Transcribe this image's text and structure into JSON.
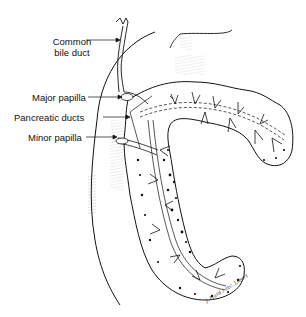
{
  "diagram": {
    "style": "black and white anatomical line drawing",
    "labels": [
      {
        "id": "common-bile-duct",
        "text_line1": "Common",
        "text_line2": "bile duct"
      },
      {
        "id": "major-papilla",
        "text": "Major papilla"
      },
      {
        "id": "pancreatic-ducts",
        "text": "Pancreatic ducts"
      },
      {
        "id": "minor-papilla",
        "text": "Minor papilla"
      }
    ],
    "signature": "J. Hard / etc. Libert",
    "colors": {
      "ink": "#111111",
      "background": "#ffffff",
      "shading": "#777777"
    }
  }
}
